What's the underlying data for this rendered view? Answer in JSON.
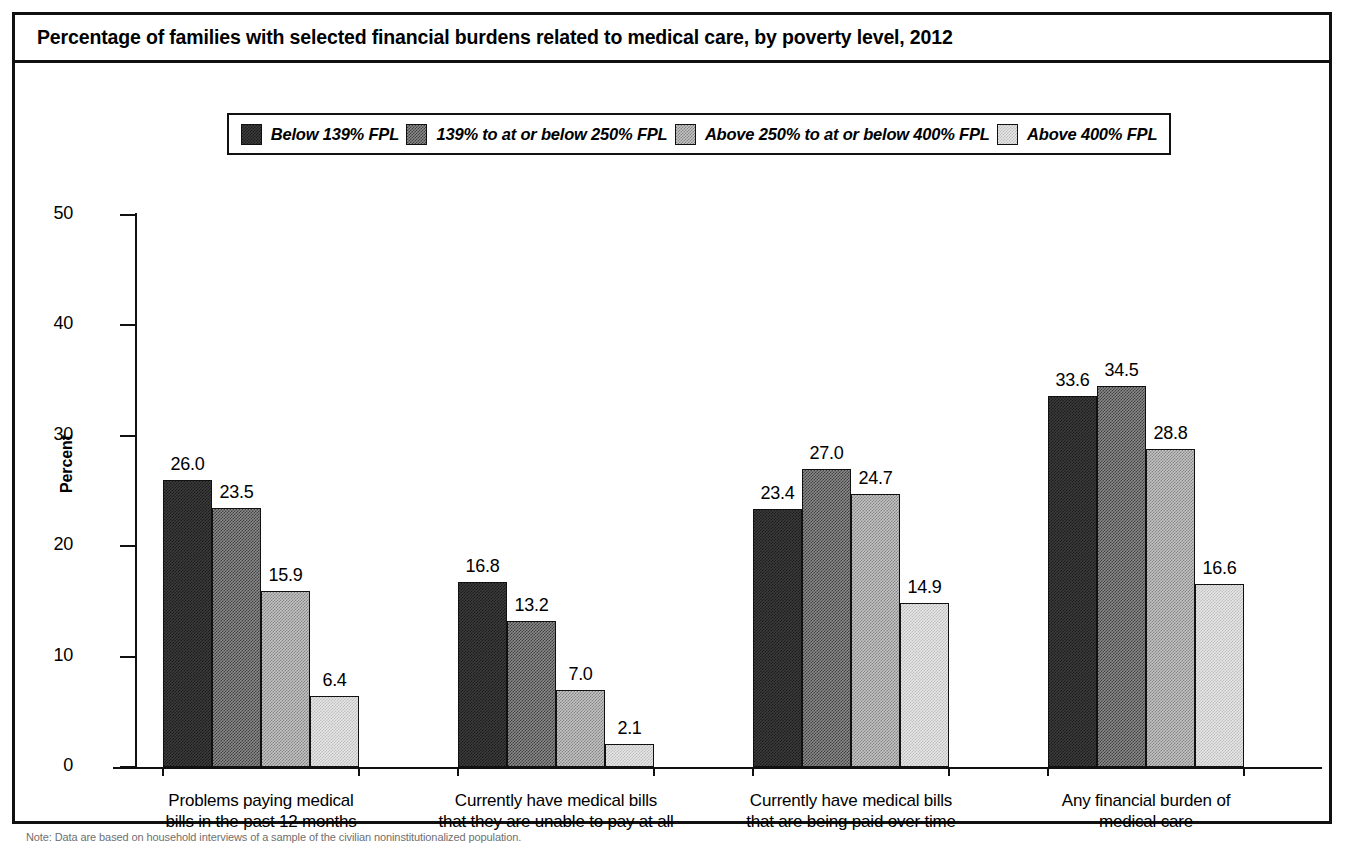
{
  "chart_title": "Percentage of families with selected financial burdens related to medical care, by poverty level, 2012",
  "y_axis_title": "Percent",
  "footnote": "Note: Data are based on household interviews of a sample of the civilian noninstitutionalized population.",
  "colors": {
    "series_0": "#1a1a1a",
    "series_1": "#5a5a5a",
    "series_2": "#a8a8a8",
    "series_3": "#dcdcdc",
    "axis": "#111111",
    "background": "#ffffff"
  },
  "chart_data": {
    "type": "bar",
    "title": "Percentage of families with selected financial burdens related to medical care, by poverty level, 2012",
    "xlabel": "",
    "ylabel": "Percent",
    "ylim": [
      0,
      50
    ],
    "yticks": [
      0,
      10,
      20,
      30,
      40,
      50
    ],
    "ytick_labels": [
      "0",
      "10",
      "20",
      "30",
      "40",
      "50"
    ],
    "grid": false,
    "legend_position": "top-center",
    "categories": [
      "Problems paying medical\nbills in the past 12 months",
      "Currently have medical bills\nthat they are unable to pay at all",
      "Currently have medical bills\nthat are being paid over time",
      "Any financial burden of\nmedical care"
    ],
    "category_lines": [
      [
        "Problems paying medical",
        "bills in the past 12 months"
      ],
      [
        "Currently have medical bills",
        "that they are unable to pay at all"
      ],
      [
        "Currently have medical bills",
        "that are being paid over time"
      ],
      [
        "Any financial burden of",
        "medical care"
      ]
    ],
    "series": [
      {
        "name": "Below 139% FPL",
        "values": [
          26.0,
          16.8,
          23.4,
          33.6
        ],
        "labels": [
          "26.0",
          "16.8",
          "23.4",
          "33.6"
        ]
      },
      {
        "name": "139% to at or below 250% FPL",
        "values": [
          23.5,
          13.2,
          27.0,
          34.5
        ],
        "labels": [
          "23.5",
          "13.2",
          "27.0",
          "34.5"
        ]
      },
      {
        "name": "Above 250% to at or below 400% FPL",
        "values": [
          15.9,
          7.0,
          24.7,
          28.8
        ],
        "labels": [
          "15.9",
          "7.0",
          "24.7",
          "28.8"
        ]
      },
      {
        "name": "Above 400% FPL",
        "values": [
          6.4,
          2.1,
          14.9,
          16.6
        ],
        "labels": [
          "6.4",
          "2.1",
          "14.9",
          "16.6"
        ]
      }
    ]
  }
}
